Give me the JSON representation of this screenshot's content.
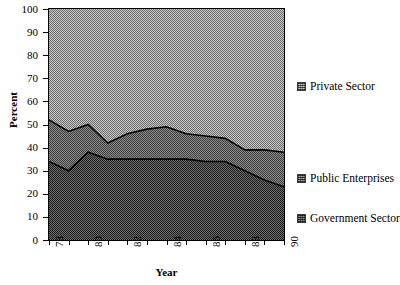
{
  "chart_data": {
    "type": "area",
    "stacked": true,
    "title": "",
    "subtitle": "",
    "xlabel": "Year",
    "ylabel": "Percent",
    "xlim": [
      78,
      90
    ],
    "ylim": [
      0,
      100
    ],
    "grid": false,
    "legend_position": "right",
    "x": [
      78,
      79,
      80,
      81,
      82,
      83,
      84,
      85,
      86,
      87,
      88,
      89,
      90
    ],
    "xtick_labels": [
      "78",
      "80",
      "82",
      "84",
      "86",
      "88",
      "90"
    ],
    "xtick_values": [
      78,
      80,
      82,
      84,
      86,
      88,
      90
    ],
    "ytick_labels": [
      "0",
      "10",
      "20",
      "30",
      "40",
      "50",
      "60",
      "70",
      "80",
      "90",
      "100"
    ],
    "ytick_values": [
      0,
      10,
      20,
      30,
      40,
      50,
      60,
      70,
      80,
      90,
      100
    ],
    "series": [
      {
        "name": "Government Sector",
        "color": "#4a4a4a",
        "values": [
          34,
          30,
          38,
          35,
          35,
          35,
          35,
          35,
          34,
          34,
          30,
          26,
          23
        ]
      },
      {
        "name": "Public Enterprises",
        "color": "#6e6e6e",
        "values": [
          18,
          17,
          12,
          7,
          11,
          13,
          14,
          11,
          11,
          10,
          9,
          13,
          15
        ]
      },
      {
        "name": "Private Sector",
        "color": "#9c9c9c",
        "values": [
          48,
          53,
          50,
          58,
          54,
          52,
          51,
          54,
          55,
          56,
          61,
          61,
          62
        ]
      }
    ],
    "cumulative_boundaries": {
      "government_top": [
        34,
        30,
        38,
        35,
        35,
        35,
        35,
        35,
        34,
        34,
        30,
        26,
        23
      ],
      "public_top": [
        52,
        47,
        50,
        42,
        46,
        48,
        49,
        46,
        45,
        44,
        39,
        39,
        38
      ]
    },
    "legend": [
      {
        "label": "Private Sector",
        "color": "#9c9c9c"
      },
      {
        "label": "Public Enterprises",
        "color": "#6e6e6e"
      },
      {
        "label": "Government Sector",
        "color": "#4a4a4a"
      }
    ]
  }
}
